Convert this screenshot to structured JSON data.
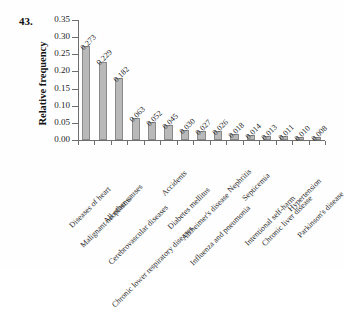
{
  "figure": {
    "problem_number": "43."
  },
  "chart_data": {
    "type": "bar",
    "title": "",
    "xlabel": "",
    "ylabel": "Relative frequency",
    "ylim": [
      0,
      0.35
    ],
    "yticks": [
      "0.00",
      "0.05",
      "0.10",
      "0.15",
      "0.20",
      "0.25",
      "0.30",
      "0.35"
    ],
    "ytick_values": [
      0.0,
      0.05,
      0.1,
      0.15,
      0.2,
      0.25,
      0.3,
      0.35
    ],
    "grid": false,
    "legend": false,
    "bar_color": "#b9b9b9",
    "bar_edge_color": "#8a8a8a",
    "axis_color": "#6e6e6e",
    "categories": [
      "Diseases of heart",
      "Malignant neoplasms",
      "All other causes",
      "Cerebrovascular diseases",
      "Chronic lower respiratory diseases",
      "Accidents",
      "Diabetes mellitus",
      "Alzheimer's disease",
      "Influenza and pneumonia",
      "Nephritis",
      "Septicemia",
      "Intentional self-harm",
      "Chronic liver disease",
      "Hypertension",
      "Parkinson's disease"
    ],
    "values": [
      0.273,
      0.229,
      0.182,
      0.063,
      0.052,
      0.045,
      0.03,
      0.027,
      0.026,
      0.018,
      0.014,
      0.013,
      0.011,
      0.01,
      0.008
    ],
    "value_labels": [
      "0.273",
      "0.229",
      "0.182",
      "0.063",
      "0.052",
      "0.045",
      "0.030",
      "0.027",
      "0.026",
      "0.018",
      "0.014",
      "0.013",
      "0.011",
      "0.010",
      "0.008"
    ]
  }
}
